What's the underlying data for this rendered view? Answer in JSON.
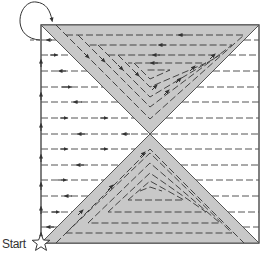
{
  "diagram": {
    "start_label": "Start",
    "square": {
      "x": 41,
      "y": 25,
      "size": 218
    },
    "colors": {
      "triangle_fill": "#c8c8c8",
      "outline": "#555555",
      "dash": "#555555",
      "background": "#ffffff"
    },
    "horizontal_rows": [
      40,
      55,
      71,
      87,
      102,
      118,
      134,
      149,
      165,
      180,
      196,
      212,
      227
    ],
    "row_directions": [
      "left",
      "right",
      "left",
      "right",
      "left",
      "right",
      "left",
      "right",
      "left",
      "right",
      "left",
      "right",
      "left"
    ],
    "top_spiral_levels": 4,
    "bottom_spiral_levels": 4
  }
}
